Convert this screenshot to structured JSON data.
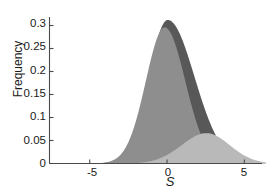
{
  "chart_data": {
    "type": "area",
    "title": "",
    "subtitle": "",
    "xlabel": "S",
    "ylabel": "Frequency",
    "xlim": [
      -7.6,
      6.4
    ],
    "ylim": [
      0,
      0.325
    ],
    "grid": false,
    "legend": null,
    "xticks": [
      -5,
      0,
      5
    ],
    "xtick_labels": [
      "-5",
      "0",
      "5"
    ],
    "yticks": [
      0,
      0.05,
      0.1,
      0.15,
      0.2,
      0.25,
      0.3
    ],
    "ytick_labels": [
      "0",
      "0.05",
      "0.1",
      "0.15",
      "0.2",
      "0.25",
      "0.3"
    ],
    "colors": {
      "dark_gray": "#585858",
      "medium_gray": "#8e8e8e",
      "light_gray": "#b9b9b9",
      "axis": "#4a4a4a",
      "text": "#1a1a1a",
      "background": "#ffffff"
    },
    "series": [
      {
        "name": "dark-distribution",
        "color": "#585858",
        "peak_x": 0.05,
        "peak_y": 0.312,
        "sigma_left": 1.25,
        "sigma_right": 1.72,
        "x": [
          -4.2,
          -3.8,
          -3.4,
          -3.0,
          -2.6,
          -2.2,
          -1.8,
          -1.4,
          -1.0,
          -0.6,
          -0.2,
          0.05,
          0.4,
          0.8,
          1.2,
          1.6,
          2.0,
          2.4,
          2.8,
          3.2,
          3.6,
          4.0,
          4.4,
          4.8,
          5.2,
          5.6,
          6.0
        ],
        "y": [
          0.002,
          0.006,
          0.013,
          0.027,
          0.05,
          0.084,
          0.129,
          0.181,
          0.233,
          0.278,
          0.308,
          0.312,
          0.304,
          0.282,
          0.25,
          0.212,
          0.172,
          0.133,
          0.098,
          0.069,
          0.046,
          0.029,
          0.017,
          0.009,
          0.005,
          0.002,
          0.001
        ]
      },
      {
        "name": "medium-distribution",
        "color": "#8e8e8e",
        "peak_x": -0.15,
        "peak_y": 0.296,
        "sigma_left": 1.22,
        "sigma_right": 1.33,
        "x": [
          -4.2,
          -3.8,
          -3.4,
          -3.0,
          -2.6,
          -2.2,
          -1.8,
          -1.4,
          -1.0,
          -0.6,
          -0.15,
          0.2,
          0.6,
          1.0,
          1.4,
          1.8,
          2.2,
          2.6,
          3.0,
          3.4,
          3.8,
          4.2,
          4.6,
          5.0,
          5.4
        ],
        "y": [
          0.002,
          0.005,
          0.012,
          0.026,
          0.049,
          0.084,
          0.131,
          0.186,
          0.24,
          0.283,
          0.296,
          0.288,
          0.262,
          0.223,
          0.176,
          0.129,
          0.087,
          0.054,
          0.031,
          0.016,
          0.008,
          0.003,
          0.001,
          0.0005,
          0.0
        ]
      },
      {
        "name": "light-distribution",
        "color": "#b9b9b9",
        "peak_x": 2.55,
        "peak_y": 0.066,
        "sigma_left": 1.6,
        "sigma_right": 1.5,
        "x": [
          -2.0,
          -1.4,
          -0.8,
          -0.2,
          0.4,
          1.0,
          1.6,
          2.0,
          2.55,
          3.0,
          3.4,
          3.8,
          4.2,
          4.6,
          5.0,
          5.4,
          5.8,
          6.1
        ],
        "y": [
          0.003,
          0.006,
          0.012,
          0.021,
          0.034,
          0.047,
          0.059,
          0.063,
          0.066,
          0.064,
          0.059,
          0.05,
          0.039,
          0.028,
          0.017,
          0.009,
          0.003,
          0.001
        ]
      }
    ]
  },
  "axes": {
    "y_label": "Frequency",
    "x_label": "S"
  }
}
